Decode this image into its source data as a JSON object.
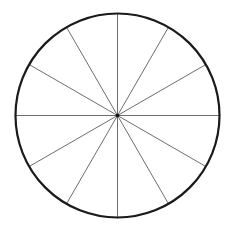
{
  "diagram": {
    "type": "circle-divided-into-sectors",
    "center": {
      "x": 117.5,
      "y": 115.5
    },
    "radius": 102,
    "sector_count": 12,
    "spoke_angles_deg": [
      0,
      30,
      60,
      90,
      120,
      150
    ],
    "colors": {
      "background": "#ffffff",
      "outline": "#1a1a1a",
      "spokes": "#6e6e6e",
      "center_dot": "#111111"
    },
    "stroke_widths": {
      "outline": 2.2,
      "spokes": 1
    }
  }
}
